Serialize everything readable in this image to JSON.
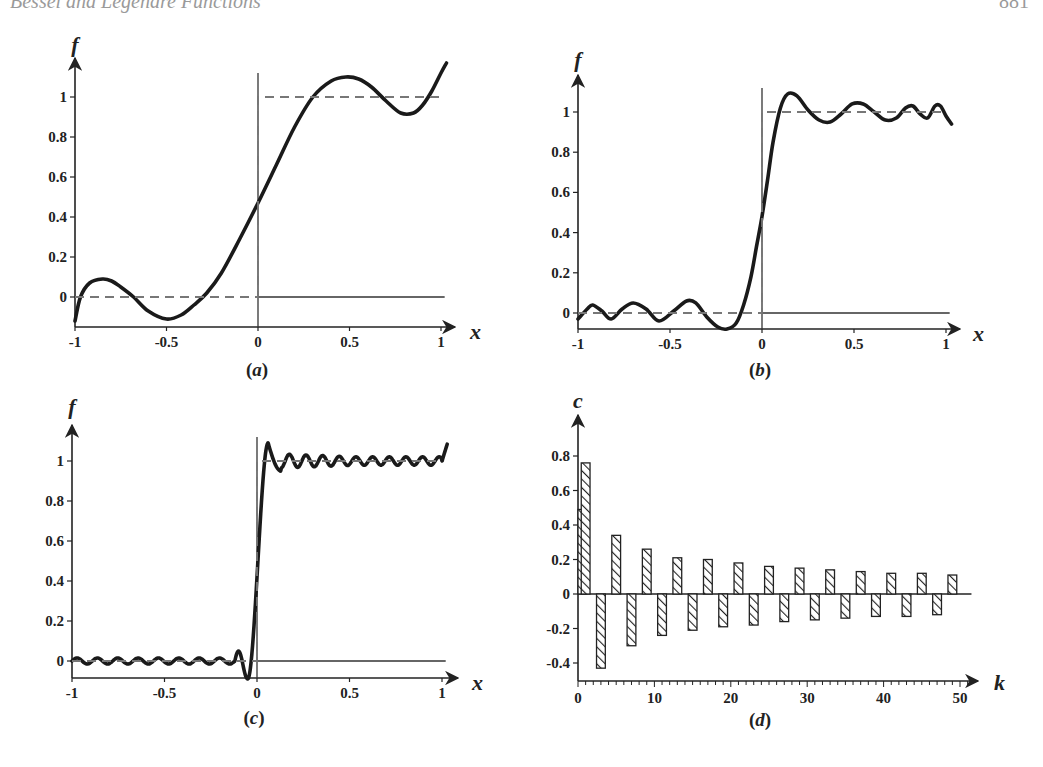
{
  "page": {
    "running_head": "Bessel and Legendre Functions",
    "page_number": "881"
  },
  "chart_data": [
    {
      "id": "a",
      "type": "line",
      "panel_label": "(a)",
      "panel_letter": "a",
      "title": "",
      "xlabel": "x",
      "ylabel": "f",
      "xlim": [
        -1,
        1.05
      ],
      "ylim": [
        -0.12,
        1.15
      ],
      "x_ticks": [
        "-1",
        "-0.5",
        "0",
        "0.5",
        "1"
      ],
      "y_ticks": [
        "0",
        "0.2",
        "0.4",
        "0.6",
        "0.8",
        "1"
      ],
      "grid": false,
      "series": [
        {
          "name": "Fourier-Legendre approximation (few terms)",
          "style": "solid-thick",
          "x": [
            -1,
            -0.97,
            -0.92,
            -0.85,
            -0.8,
            -0.75,
            -0.68,
            -0.6,
            -0.5,
            -0.42,
            -0.35,
            -0.28,
            -0.2,
            -0.1,
            0,
            0.1,
            0.2,
            0.3,
            0.4,
            0.48,
            0.55,
            0.62,
            0.7,
            0.78,
            0.85,
            0.9,
            0.95,
            1.0,
            1.03
          ],
          "y": [
            -0.12,
            0.0,
            0.07,
            0.09,
            0.08,
            0.05,
            0.0,
            -0.07,
            -0.11,
            -0.09,
            -0.04,
            0.02,
            0.12,
            0.29,
            0.47,
            0.66,
            0.85,
            1.0,
            1.08,
            1.1,
            1.09,
            1.05,
            0.98,
            0.92,
            0.92,
            0.96,
            1.03,
            1.12,
            1.17
          ]
        },
        {
          "name": "step function",
          "style": "dashed",
          "x": [
            -1,
            0,
            0,
            1.0
          ],
          "y": [
            0,
            0,
            1,
            1
          ]
        }
      ]
    },
    {
      "id": "b",
      "type": "line",
      "panel_label": "(b)",
      "panel_letter": "b",
      "xlabel": "x",
      "ylabel": "f",
      "xlim": [
        -1,
        1.05
      ],
      "ylim": [
        -0.08,
        1.15
      ],
      "x_ticks": [
        "-1",
        "-0.5",
        "0",
        "0.5",
        "1"
      ],
      "y_ticks": [
        "0",
        "0.2",
        "0.4",
        "0.6",
        "0.8",
        "1"
      ],
      "grid": false,
      "series": [
        {
          "name": "Fourier-Legendre approximation (more terms)",
          "style": "solid-thick",
          "x": [
            -1,
            -0.95,
            -0.92,
            -0.87,
            -0.82,
            -0.76,
            -0.7,
            -0.63,
            -0.56,
            -0.48,
            -0.41,
            -0.36,
            -0.3,
            -0.24,
            -0.19,
            -0.14,
            -0.1,
            -0.06,
            -0.03,
            0,
            0.03,
            0.06,
            0.1,
            0.14,
            0.19,
            0.25,
            0.31,
            0.37,
            0.43,
            0.49,
            0.55,
            0.61,
            0.67,
            0.73,
            0.78,
            0.82,
            0.86,
            0.9,
            0.94,
            0.97,
            1.0,
            1.03
          ],
          "y": [
            -0.03,
            0.02,
            0.04,
            0.01,
            -0.03,
            0.02,
            0.05,
            0.02,
            -0.04,
            0.01,
            0.06,
            0.05,
            -0.02,
            -0.07,
            -0.08,
            -0.05,
            0.04,
            0.18,
            0.33,
            0.48,
            0.66,
            0.85,
            1.02,
            1.09,
            1.08,
            1.01,
            0.96,
            0.95,
            0.99,
            1.04,
            1.04,
            1.0,
            0.96,
            0.97,
            1.02,
            1.03,
            0.99,
            0.97,
            1.03,
            1.03,
            0.98,
            0.94
          ]
        },
        {
          "name": "step function",
          "style": "dashed",
          "x": [
            -1,
            0,
            0,
            1.0
          ],
          "y": [
            0,
            0,
            1,
            1
          ]
        }
      ]
    },
    {
      "id": "c",
      "type": "line",
      "panel_label": "(c)",
      "panel_letter": "c",
      "xlabel": "x",
      "ylabel": "f",
      "xlim": [
        -1,
        1.05
      ],
      "ylim": [
        -0.09,
        1.15
      ],
      "x_ticks": [
        "-1",
        "-0.5",
        "0",
        "0.5",
        "1"
      ],
      "y_ticks": [
        "0",
        "0.2",
        "0.4",
        "0.6",
        "0.8",
        "1"
      ],
      "grid": false,
      "series": [
        {
          "name": "Fourier-Legendre approximation (many terms)",
          "style": "solid-thick",
          "description": "small oscillation around 0 for x<0 (amplitude ~0.015), undershoot -0.09 at x~-0.05, steep rise near x=0, overshoot 1.09 at x~0.06, small oscillations around 1 for x>0",
          "x": [
            -1,
            -0.06,
            -0.03,
            0,
            0.03,
            0.06,
            0.1,
            0.14,
            1.0
          ],
          "y": [
            0,
            -0.09,
            0.2,
            0.5,
            0.9,
            1.09,
            1.0,
            0.95,
            1.0
          ]
        },
        {
          "name": "step function",
          "style": "dashed",
          "x": [
            -1,
            0,
            0,
            1.0
          ],
          "y": [
            0,
            0,
            1,
            1
          ]
        }
      ]
    },
    {
      "id": "d",
      "type": "bar",
      "panel_label": "(d)",
      "panel_letter": "d",
      "xlabel": "k",
      "ylabel": "c",
      "xlim": [
        0,
        52
      ],
      "ylim": [
        -0.43,
        0.85
      ],
      "x_ticks": [
        "0",
        "10",
        "20",
        "30",
        "40",
        "50"
      ],
      "y_ticks": [
        "-0.4",
        "-0.2",
        "0",
        "0.2",
        "0.4",
        "0.6",
        "0.8"
      ],
      "grid": false,
      "bar_style": "hatched",
      "categories": [
        0,
        1,
        3,
        5,
        7,
        9,
        11,
        13,
        15,
        17,
        19,
        21,
        23,
        25,
        27,
        29,
        31,
        33,
        35,
        37,
        39,
        41,
        43,
        45,
        47,
        49
      ],
      "values": [
        0.49,
        0.76,
        -0.43,
        0.34,
        -0.3,
        0.26,
        -0.24,
        0.21,
        -0.21,
        0.2,
        -0.19,
        0.18,
        -0.18,
        0.16,
        -0.16,
        0.15,
        -0.15,
        0.14,
        -0.14,
        0.13,
        -0.13,
        0.12,
        -0.13,
        0.12,
        -0.12,
        0.11
      ]
    }
  ]
}
